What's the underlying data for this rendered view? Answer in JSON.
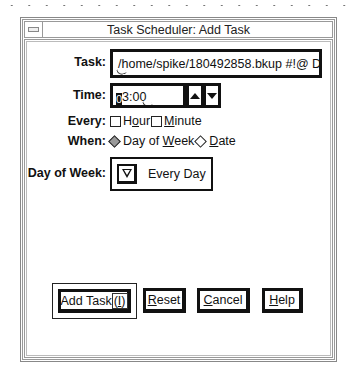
{
  "window": {
    "title": "Task Scheduler: Add Task"
  },
  "form": {
    "task": {
      "label": "Task:",
      "value": "/home/spike/180492858.bkup #!@ Do"
    },
    "time": {
      "label": "Time:",
      "value_first_char": "0",
      "value_rest": "3:00",
      "up_icon": "triangle-up",
      "down_icon": "triangle-down"
    },
    "every": {
      "label": "Every:",
      "options": [
        {
          "pre": "H",
          "mnemonic": "o",
          "post": "ur",
          "checked": false
        },
        {
          "pre": "",
          "mnemonic": "M",
          "post": "inute",
          "checked": false
        }
      ]
    },
    "when": {
      "label": "When:",
      "options": [
        {
          "pre": "Day of ",
          "mnemonic": "W",
          "post": "eek",
          "selected": true
        },
        {
          "pre": "",
          "mnemonic": "D",
          "post": "ate",
          "selected": false
        }
      ]
    },
    "day_of_week": {
      "label": "Day of Week:",
      "value": "Every Day",
      "icon": "triangle-down-outline"
    }
  },
  "buttons": {
    "add_task": {
      "pre": "Add Task",
      "focus": "(I)",
      "mnemonic": "I",
      "default": true
    },
    "reset": {
      "mnemonic": "R",
      "post": "eset"
    },
    "cancel": {
      "mnemonic": "C",
      "post": "ancel"
    },
    "help": {
      "mnemonic": "H",
      "post": "elp"
    }
  }
}
